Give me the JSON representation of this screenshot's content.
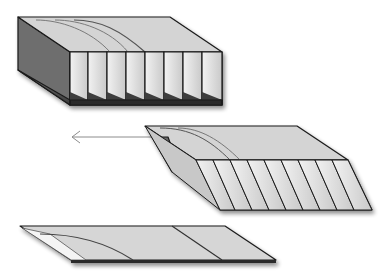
{
  "figure": {
    "parts": [
      {
        "id": "top",
        "label": "expanded block with vertical partitions",
        "partition_count": 8
      },
      {
        "id": "middle",
        "label": "sheared block with angled partitions",
        "partition_count": 9
      },
      {
        "id": "bottom",
        "label": "fully collapsed flat panel"
      }
    ],
    "arrow": {
      "direction": "left"
    },
    "colors": {
      "face_light": "#dcdcdc",
      "face_top": "#d4d4d4",
      "face_dark": "#6e6e6e",
      "face_mid": "#a9a9a9",
      "outline": "#1a1a1a",
      "arrow": "#8c8c8c",
      "background": "#ffffff"
    }
  }
}
